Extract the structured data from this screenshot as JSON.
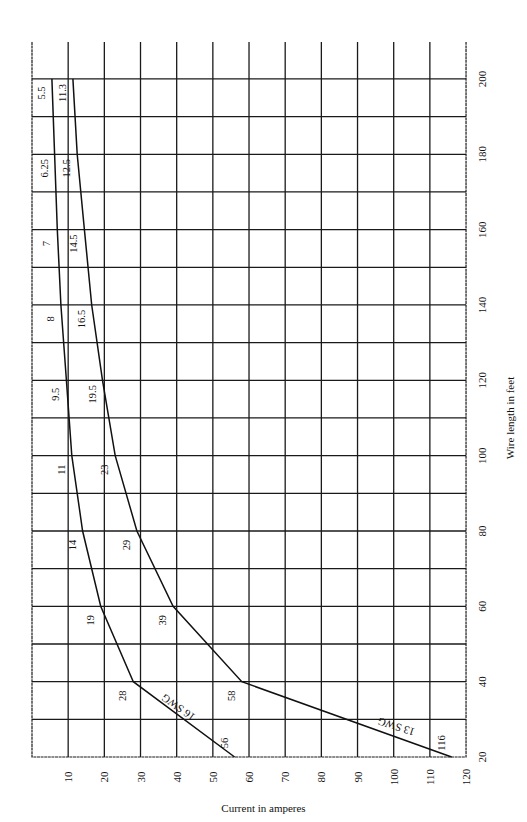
{
  "chart_data": {
    "type": "line",
    "orientation": "rotated 90deg (page printed sideways)",
    "title": "",
    "xlabel": "Current in amperes",
    "ylabel": "Wire length in feet",
    "x_axis": {
      "label": "Current in amperes",
      "range": [
        0,
        120
      ],
      "ticks": [
        10,
        20,
        30,
        40,
        50,
        60,
        70,
        80,
        90,
        100,
        110,
        120
      ]
    },
    "y_axis": {
      "label": "Wire length in feet",
      "range": [
        20,
        210
      ],
      "ticks": [
        20,
        40,
        60,
        80,
        100,
        120,
        140,
        160,
        180,
        200
      ],
      "minor_grid_step": 10
    },
    "grid": true,
    "x": [
      20,
      40,
      60,
      80,
      100,
      120,
      140,
      160,
      180,
      200
    ],
    "series": [
      {
        "name": "16 SWG",
        "label": "16 SWG",
        "lengths_ft": [
          20,
          40,
          60,
          80,
          100,
          120,
          140,
          160,
          180,
          200
        ],
        "current_amps": [
          56,
          28,
          19,
          14,
          11,
          9.5,
          8,
          7,
          6.25,
          5.5
        ],
        "point_labels": [
          "56",
          "28",
          "19",
          "14",
          "11",
          "9.5",
          "8",
          "7",
          "6.25",
          "5.5"
        ]
      },
      {
        "name": "13 SWG",
        "label": "13 SWG",
        "lengths_ft": [
          20,
          40,
          60,
          80,
          100,
          120,
          140,
          160,
          180,
          200
        ],
        "current_amps": [
          116,
          58,
          39,
          29,
          23,
          19.5,
          16.5,
          14.5,
          12.5,
          11.3
        ],
        "point_labels": [
          "116",
          "58",
          "39",
          "29",
          "23",
          "19.5",
          "16.5",
          "14.5",
          "12.5",
          "11.3"
        ]
      }
    ],
    "legend": "inline labels on curves"
  },
  "colors": {
    "ink": "#111111",
    "paper": "#ffffff"
  }
}
